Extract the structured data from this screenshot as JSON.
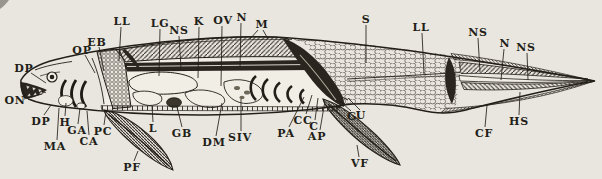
{
  "figure": {
    "kind": "anatomical line diagram"
  },
  "colors": {
    "paper": "#e9e6df",
    "ink": "#221e18",
    "organ_fill": "#f1eee6",
    "shade": "#2a261f"
  },
  "labels": [
    {
      "text": "LL",
      "x": 122,
      "y": 21,
      "lines": [
        [
          121,
          27,
          119,
          61
        ]
      ]
    },
    {
      "text": "LG",
      "x": 160,
      "y": 23,
      "lines": [
        [
          160,
          29,
          159,
          76
        ]
      ]
    },
    {
      "text": "NS",
      "x": 179,
      "y": 30,
      "lines": [
        [
          179,
          36,
          181,
          68
        ]
      ]
    },
    {
      "text": "K",
      "x": 199,
      "y": 21,
      "lines": [
        [
          199,
          27,
          198,
          78
        ]
      ]
    },
    {
      "text": "OV",
      "x": 223,
      "y": 20,
      "lines": [
        [
          222,
          26,
          221,
          86
        ]
      ]
    },
    {
      "text": "N",
      "x": 242,
      "y": 17,
      "lines": [
        [
          241,
          23,
          240,
          67
        ]
      ]
    },
    {
      "text": "M",
      "x": 262,
      "y": 24,
      "lines": [
        [
          258,
          30,
          250,
          39
        ],
        [
          263,
          30,
          268,
          39
        ]
      ]
    },
    {
      "text": "S",
      "x": 366,
      "y": 19,
      "lines": [
        [
          366,
          25,
          366,
          63
        ]
      ]
    },
    {
      "text": "LL",
      "x": 421,
      "y": 27,
      "lines": [
        [
          422,
          33,
          424,
          74
        ]
      ]
    },
    {
      "text": "NS",
      "x": 478,
      "y": 32,
      "lines": [
        [
          478,
          38,
          480,
          72
        ]
      ]
    },
    {
      "text": "N",
      "x": 505,
      "y": 43,
      "lines": [
        [
          504,
          49,
          501,
          80
        ]
      ]
    },
    {
      "text": "NS",
      "x": 526,
      "y": 47,
      "lines": [
        [
          527,
          53,
          528,
          80
        ]
      ]
    },
    {
      "text": "DP",
      "x": 24,
      "y": 68,
      "lines": [
        [
          31,
          73,
          46,
          83
        ]
      ]
    },
    {
      "text": "ON",
      "x": 15,
      "y": 100,
      "lines": [
        [
          24,
          99,
          42,
          94
        ]
      ]
    },
    {
      "text": "DP",
      "x": 41,
      "y": 121,
      "lines": [
        [
          44,
          115,
          51,
          105
        ]
      ]
    },
    {
      "text": "OP",
      "x": 82,
      "y": 50,
      "lines": [
        [
          85,
          55,
          95,
          73
        ]
      ]
    },
    {
      "text": "EB",
      "x": 97,
      "y": 42,
      "lines": [
        [
          99,
          47,
          104,
          71
        ]
      ]
    },
    {
      "text": "MA",
      "x": 55,
      "y": 146,
      "lines": [
        [
          57,
          140,
          59,
          108
        ]
      ]
    },
    {
      "text": "H",
      "x": 65,
      "y": 122,
      "lines": [
        [
          65,
          116,
          66,
          103
        ]
      ]
    },
    {
      "text": "GA",
      "x": 77,
      "y": 130,
      "lines": [
        [
          78,
          124,
          80,
          108
        ]
      ]
    },
    {
      "text": "CA",
      "x": 89,
      "y": 141,
      "lines": [
        [
          89,
          135,
          87,
          111
        ]
      ]
    },
    {
      "text": "PC",
      "x": 103,
      "y": 131,
      "lines": [
        [
          104,
          125,
          106,
          111
        ]
      ]
    },
    {
      "text": "L",
      "x": 153,
      "y": 128,
      "lines": [
        [
          153,
          122,
          152,
          106
        ]
      ]
    },
    {
      "text": "GB",
      "x": 182,
      "y": 133,
      "lines": [
        [
          182,
          127,
          177,
          107
        ]
      ]
    },
    {
      "text": "DM",
      "x": 214,
      "y": 142,
      "lines": [
        [
          216,
          136,
          222,
          103
        ]
      ]
    },
    {
      "text": "SIV",
      "x": 240,
      "y": 137,
      "lines": [
        [
          241,
          131,
          241,
          99
        ]
      ]
    },
    {
      "text": "PF",
      "x": 132,
      "y": 167,
      "lines": [
        [
          134,
          161,
          138,
          151
        ]
      ]
    },
    {
      "text": "PA",
      "x": 286,
      "y": 133,
      "lines": [
        [
          289,
          127,
          304,
          97
        ]
      ]
    },
    {
      "text": "CC",
      "x": 303,
      "y": 120,
      "lines": [
        [
          306,
          114,
          312,
          95
        ]
      ]
    },
    {
      "text": "C",
      "x": 314,
      "y": 126,
      "lines": [
        [
          315,
          120,
          318,
          98
        ]
      ]
    },
    {
      "text": "AP",
      "x": 317,
      "y": 136,
      "lines": [
        [
          320,
          130,
          325,
          101
        ]
      ]
    },
    {
      "text": "G",
      "x": 352,
      "y": 116,
      "lines": [
        [
          351,
          111,
          342,
          103
        ]
      ]
    },
    {
      "text": "U",
      "x": 361,
      "y": 115,
      "lines": [
        [
          360,
          110,
          348,
          98
        ]
      ]
    },
    {
      "text": "VF",
      "x": 360,
      "y": 163,
      "lines": [
        [
          359,
          157,
          357,
          145
        ]
      ]
    },
    {
      "text": "CF",
      "x": 484,
      "y": 133,
      "lines": [
        [
          485,
          127,
          487,
          105
        ]
      ]
    },
    {
      "text": "HS",
      "x": 519,
      "y": 121,
      "lines": [
        [
          519,
          115,
          520,
          92
        ]
      ]
    }
  ]
}
